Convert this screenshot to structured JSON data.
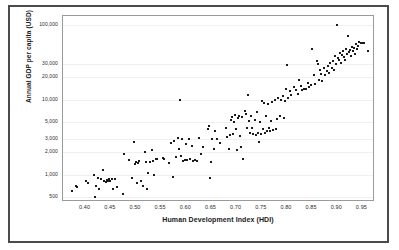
{
  "chart_data": {
    "type": "scatter",
    "title": "",
    "xlabel": "Human Development Index (HDI)",
    "ylabel": "Annual GDP per capita (USD)",
    "xlim": [
      0.355,
      0.975
    ],
    "ylim": [
      430,
      130000
    ],
    "yscale": "log",
    "xscale": "linear",
    "grid": "horizontal-faint",
    "legend": "none",
    "xticks": [
      "0.40",
      "0.45",
      "0.50",
      "0.55",
      "0.60",
      "0.65",
      "0.70",
      "0.75",
      "0.80",
      "0.85",
      "0.90",
      "0.95"
    ],
    "xtick_values": [
      0.4,
      0.45,
      0.5,
      0.55,
      0.6,
      0.65,
      0.7,
      0.75,
      0.8,
      0.85,
      0.9,
      0.95
    ],
    "yticks": [
      "500",
      "1,000",
      "2,000",
      "3,000",
      "5,000",
      "10,000",
      "20,000",
      "30,000",
      "100,000"
    ],
    "ytick_values": [
      500,
      1000,
      2000,
      3000,
      5000,
      10000,
      20000,
      30000,
      100000
    ],
    "marker": "square",
    "marker_color": "#1a1a1a",
    "marker_size": 2,
    "n_points": 191,
    "points": [
      [
        0.372,
        600
      ],
      [
        0.381,
        700
      ],
      [
        0.383,
        690
      ],
      [
        0.4,
        820
      ],
      [
        0.405,
        760
      ],
      [
        0.417,
        1000
      ],
      [
        0.418,
        500
      ],
      [
        0.42,
        700
      ],
      [
        0.424,
        900
      ],
      [
        0.427,
        640
      ],
      [
        0.43,
        880
      ],
      [
        0.434,
        1150
      ],
      [
        0.437,
        830
      ],
      [
        0.44,
        800
      ],
      [
        0.443,
        845
      ],
      [
        0.445,
        830
      ],
      [
        0.447,
        860
      ],
      [
        0.449,
        810
      ],
      [
        0.452,
        880
      ],
      [
        0.455,
        640
      ],
      [
        0.458,
        870
      ],
      [
        0.462,
        690
      ],
      [
        0.474,
        550
      ],
      [
        0.477,
        1900
      ],
      [
        0.487,
        1550
      ],
      [
        0.492,
        900
      ],
      [
        0.496,
        2700
      ],
      [
        0.498,
        1400
      ],
      [
        0.5,
        1480
      ],
      [
        0.502,
        780
      ],
      [
        0.505,
        1420
      ],
      [
        0.507,
        1500
      ],
      [
        0.51,
        820
      ],
      [
        0.513,
        700
      ],
      [
        0.517,
        2000
      ],
      [
        0.519,
        1460
      ],
      [
        0.521,
        640
      ],
      [
        0.524,
        1050
      ],
      [
        0.527,
        1480
      ],
      [
        0.531,
        2100
      ],
      [
        0.533,
        1530
      ],
      [
        0.535,
        980
      ],
      [
        0.539,
        1620
      ],
      [
        0.542,
        1600
      ],
      [
        0.553,
        1640
      ],
      [
        0.556,
        1620
      ],
      [
        0.566,
        1430
      ],
      [
        0.57,
        2600
      ],
      [
        0.573,
        920
      ],
      [
        0.576,
        2800
      ],
      [
        0.58,
        1700
      ],
      [
        0.583,
        3100
      ],
      [
        0.586,
        2200
      ],
      [
        0.588,
        10000
      ],
      [
        0.59,
        1750
      ],
      [
        0.592,
        3000
      ],
      [
        0.594,
        1520
      ],
      [
        0.597,
        1560
      ],
      [
        0.6,
        2550
      ],
      [
        0.602,
        1580
      ],
      [
        0.605,
        3000
      ],
      [
        0.608,
        1600
      ],
      [
        0.611,
        2400
      ],
      [
        0.614,
        1530
      ],
      [
        0.618,
        1540
      ],
      [
        0.622,
        1500
      ],
      [
        0.626,
        3050
      ],
      [
        0.629,
        1850
      ],
      [
        0.634,
        2300
      ],
      [
        0.644,
        4100
      ],
      [
        0.646,
        4400
      ],
      [
        0.648,
        900
      ],
      [
        0.65,
        1450
      ],
      [
        0.652,
        3000
      ],
      [
        0.655,
        2200
      ],
      [
        0.658,
        3800
      ],
      [
        0.662,
        3000
      ],
      [
        0.666,
        2650
      ],
      [
        0.678,
        4150
      ],
      [
        0.681,
        3200
      ],
      [
        0.684,
        2200
      ],
      [
        0.686,
        3400
      ],
      [
        0.689,
        5400
      ],
      [
        0.691,
        5800
      ],
      [
        0.693,
        3450
      ],
      [
        0.695,
        5000
      ],
      [
        0.697,
        6200
      ],
      [
        0.699,
        4000
      ],
      [
        0.701,
        2100
      ],
      [
        0.703,
        5600
      ],
      [
        0.705,
        6100
      ],
      [
        0.707,
        3300
      ],
      [
        0.709,
        2300
      ],
      [
        0.711,
        5900
      ],
      [
        0.713,
        1600
      ],
      [
        0.716,
        7000
      ],
      [
        0.718,
        6400
      ],
      [
        0.72,
        4200
      ],
      [
        0.722,
        11500
      ],
      [
        0.724,
        5100
      ],
      [
        0.726,
        3550
      ],
      [
        0.728,
        6000
      ],
      [
        0.731,
        4200
      ],
      [
        0.733,
        3500
      ],
      [
        0.736,
        5300
      ],
      [
        0.738,
        3400
      ],
      [
        0.74,
        6800
      ],
      [
        0.742,
        3600
      ],
      [
        0.744,
        2750
      ],
      [
        0.746,
        5000
      ],
      [
        0.748,
        3500
      ],
      [
        0.75,
        9500
      ],
      [
        0.752,
        4000
      ],
      [
        0.754,
        9000
      ],
      [
        0.756,
        3600
      ],
      [
        0.758,
        6000
      ],
      [
        0.76,
        3800
      ],
      [
        0.762,
        8600
      ],
      [
        0.764,
        4200
      ],
      [
        0.766,
        3800
      ],
      [
        0.768,
        5200
      ],
      [
        0.77,
        9200
      ],
      [
        0.773,
        3900
      ],
      [
        0.776,
        10000
      ],
      [
        0.778,
        4000
      ],
      [
        0.78,
        5500
      ],
      [
        0.783,
        10500
      ],
      [
        0.786,
        6100
      ],
      [
        0.789,
        9800
      ],
      [
        0.792,
        11000
      ],
      [
        0.794,
        5700
      ],
      [
        0.796,
        9500
      ],
      [
        0.799,
        14000
      ],
      [
        0.801,
        29000
      ],
      [
        0.803,
        10500
      ],
      [
        0.806,
        13000
      ],
      [
        0.809,
        11500
      ],
      [
        0.815,
        14500
      ],
      [
        0.818,
        13500
      ],
      [
        0.821,
        12000
      ],
      [
        0.824,
        18000
      ],
      [
        0.827,
        15000
      ],
      [
        0.83,
        13200
      ],
      [
        0.834,
        14000
      ],
      [
        0.837,
        13800
      ],
      [
        0.841,
        16500
      ],
      [
        0.844,
        14500
      ],
      [
        0.847,
        15500
      ],
      [
        0.85,
        47000
      ],
      [
        0.853,
        21000
      ],
      [
        0.856,
        16000
      ],
      [
        0.859,
        33000
      ],
      [
        0.862,
        30000
      ],
      [
        0.864,
        18500
      ],
      [
        0.866,
        25000
      ],
      [
        0.868,
        22000
      ],
      [
        0.87,
        17500
      ],
      [
        0.873,
        26000
      ],
      [
        0.876,
        21500
      ],
      [
        0.879,
        24000
      ],
      [
        0.882,
        28000
      ],
      [
        0.884,
        22500
      ],
      [
        0.886,
        30500
      ],
      [
        0.889,
        26500
      ],
      [
        0.891,
        33000
      ],
      [
        0.893,
        24500
      ],
      [
        0.896,
        38000
      ],
      [
        0.898,
        30000
      ],
      [
        0.9,
        100000
      ],
      [
        0.902,
        36000
      ],
      [
        0.904,
        34000
      ],
      [
        0.906,
        42000
      ],
      [
        0.908,
        31000
      ],
      [
        0.91,
        39000
      ],
      [
        0.912,
        45000
      ],
      [
        0.914,
        36500
      ],
      [
        0.916,
        33500
      ],
      [
        0.918,
        47000
      ],
      [
        0.92,
        40000
      ],
      [
        0.922,
        71000
      ],
      [
        0.924,
        43000
      ],
      [
        0.926,
        46000
      ],
      [
        0.928,
        38500
      ],
      [
        0.93,
        50000
      ],
      [
        0.932,
        44000
      ],
      [
        0.934,
        48000
      ],
      [
        0.936,
        41000
      ],
      [
        0.938,
        55000
      ],
      [
        0.94,
        46500
      ],
      [
        0.942,
        52000
      ],
      [
        0.944,
        58000
      ],
      [
        0.947,
        56000
      ],
      [
        0.95,
        57000
      ],
      [
        0.954,
        56500
      ],
      [
        0.962,
        44000
      ]
    ]
  }
}
